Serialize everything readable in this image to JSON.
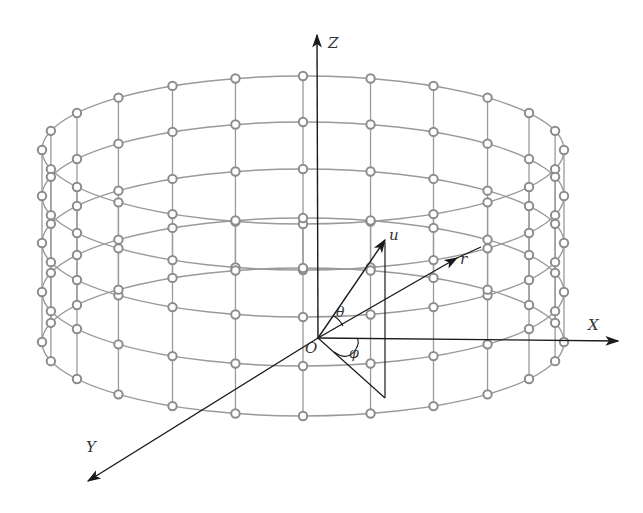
{
  "figure": {
    "type": "cylindrical array geometry",
    "colors": {
      "grid": "#9a9a9a",
      "node_fill": "#ffffff",
      "node_stroke": "#8c8c8c",
      "axis": "#1a1a1a",
      "background": "#ffffff"
    },
    "cylinder": {
      "center_x": 303,
      "radius_x": 261,
      "radius_y": 74,
      "ring_centers_y": [
        150,
        196,
        243,
        292,
        342
      ],
      "nodes_per_ring": 24
    },
    "origin": {
      "x": 318,
      "y": 338
    },
    "axes": {
      "Z": {
        "label": "Z",
        "tip": [
          317,
          35
        ]
      },
      "X": {
        "label": "X",
        "tip": [
          618,
          341
        ]
      },
      "Y": {
        "label": "Y",
        "tip": [
          88,
          481
        ]
      }
    },
    "vectors": {
      "u": {
        "label": "u",
        "tip": [
          385,
          240
        ]
      },
      "r": {
        "label": "r",
        "tip": [
          457,
          258
        ]
      }
    },
    "angles": {
      "theta": "θ",
      "phi": "φ"
    },
    "origin_label": "O"
  }
}
